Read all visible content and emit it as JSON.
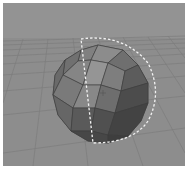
{
  "viewport": {
    "label": "3D perspective viewport",
    "background_color": "#8a8a8a",
    "grid_color": "#7a7a7a",
    "object": {
      "type": "geodesic-sphere",
      "selected": true,
      "selection_outline": "dashed-white"
    }
  }
}
